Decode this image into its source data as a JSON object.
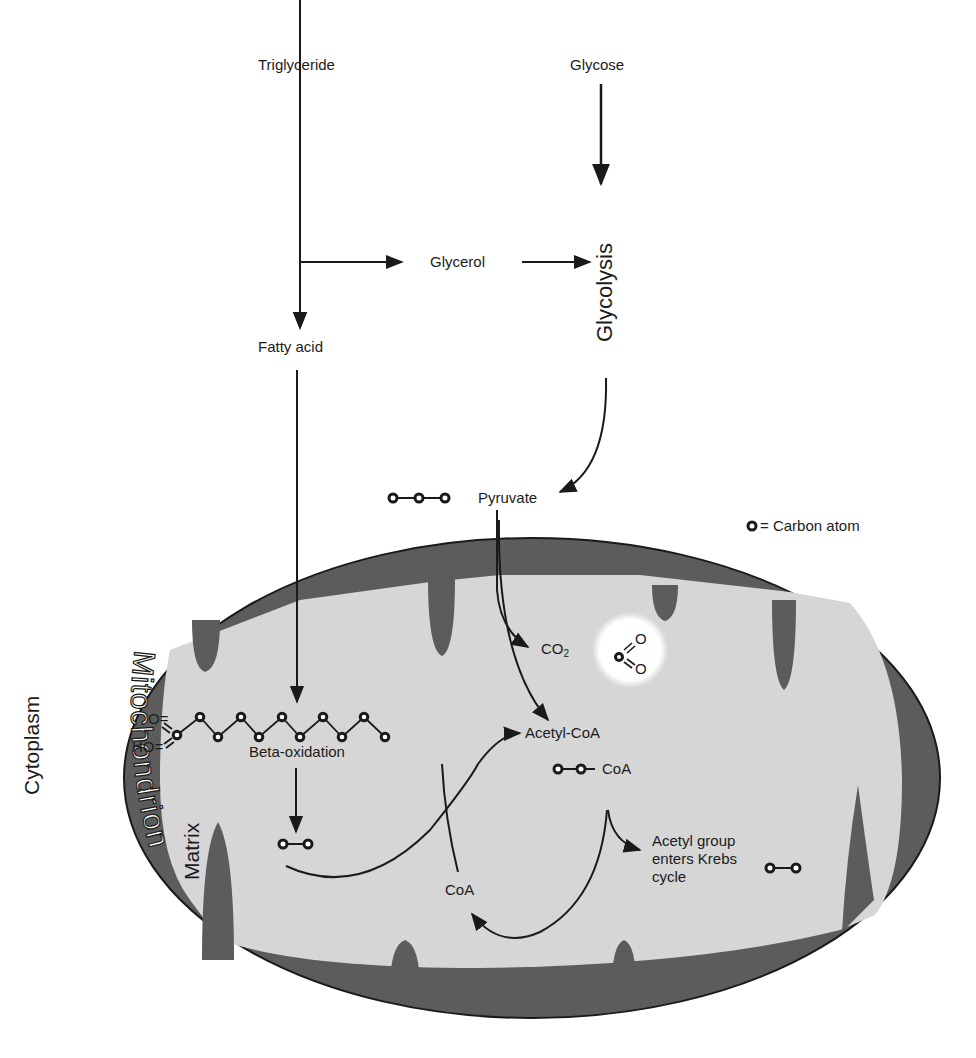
{
  "diagram": {
    "colors": {
      "background": "#ffffff",
      "membrane": "#5c5c5c",
      "membrane_outline": "#1a1a1a",
      "matrix": "#d4d4d4",
      "arrow": "#1a1a1a",
      "co2_glow": "#ffffff",
      "text": "#1c1c1c"
    },
    "nodes": {
      "triglyceride": "Triglyceride",
      "glycose": "Glycose",
      "glycerol": "Glycerol",
      "glycolysis": "Glycolysis",
      "fatty_acid": "Fatty acid",
      "pyruvate": "Pyruvate",
      "co2_main": "CO",
      "co2_sub": "2",
      "acetyl_coa": "Acetyl-CoA",
      "acetyl_coa_formula_suffix": "CoA",
      "beta_oxidation": "Beta-oxidation",
      "coa": "CoA",
      "krebs": [
        "Acetyl group",
        "enters Krebs",
        "cycle"
      ]
    },
    "regions": {
      "cytoplasm": "Cytoplasm",
      "mitochondrion": "Mitochondrion",
      "matrix": "Matrix"
    },
    "legend": {
      "symbol": "carbon-atom",
      "text": "= Carbon atom"
    },
    "molecules": {
      "pyruvate_carbons": 3,
      "fatty_acid_chain_carbons": 12,
      "fatty_acid_groups": [
        "O=",
        "HO="
      ],
      "acetyl_unit_carbons": 2,
      "co2_atoms": [
        "O",
        "O"
      ]
    },
    "edges": [
      {
        "from": "Triglyceride",
        "to": "Fatty acid"
      },
      {
        "from": "Triglyceride",
        "to": "Glycerol"
      },
      {
        "from": "Glycerol",
        "to": "Glycolysis"
      },
      {
        "from": "Glycose",
        "to": "Glycolysis"
      },
      {
        "from": "Glycolysis",
        "to": "Pyruvate"
      },
      {
        "from": "Pyruvate",
        "to": "CO2"
      },
      {
        "from": "Pyruvate",
        "to": "Acetyl-CoA"
      },
      {
        "from": "Fatty acid",
        "to": "Beta-oxidation"
      },
      {
        "from": "Beta-oxidation",
        "to": "2-carbon unit"
      },
      {
        "from": "2-carbon unit",
        "to": "Acetyl-CoA"
      },
      {
        "from": "CoA",
        "to": "Acetyl-CoA"
      },
      {
        "from": "Acetyl-CoA",
        "to": "Krebs cycle"
      },
      {
        "from": "Acetyl-CoA",
        "to": "CoA"
      }
    ]
  }
}
